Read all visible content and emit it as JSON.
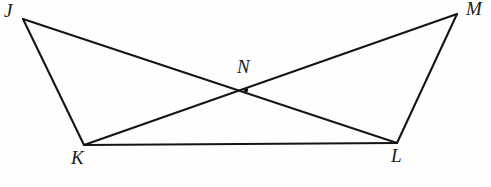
{
  "figure": {
    "background_color": "#fefefe",
    "line_color": "#151515",
    "line_width": 2.1,
    "canvas": {
      "width": 491,
      "height": 187
    },
    "points": {
      "J": {
        "label": "J",
        "x": 23,
        "y": 19,
        "label_x": 11,
        "label_y": 16
      },
      "M": {
        "label": "M",
        "x": 457,
        "y": 14,
        "label_x": 473,
        "label_y": 14
      },
      "K": {
        "label": "K",
        "x": 84,
        "y": 145,
        "label_x": 78,
        "label_y": 163
      },
      "L": {
        "label": "L",
        "x": 397,
        "y": 143,
        "label_x": 398,
        "label_y": 161
      },
      "N": {
        "label": "N",
        "x": 246,
        "y": 90,
        "label_x": 244,
        "label_y": 72
      }
    },
    "segments": [
      {
        "name": "segment-JK",
        "from": "J",
        "to": "K",
        "path": "M 23 19 L 84 145"
      },
      {
        "name": "segment-JL",
        "from": "J",
        "to": "L",
        "path": "M 23 19 L 397 143"
      },
      {
        "name": "segment-KM",
        "from": "K",
        "to": "M",
        "path": "M 84 145 L 457 14"
      },
      {
        "name": "segment-KL",
        "from": "K",
        "to": "L",
        "path": "M 84 145 L 397 143"
      },
      {
        "name": "segment-LM",
        "from": "L",
        "to": "M",
        "path": "M 397 143 L 457 14"
      }
    ]
  }
}
